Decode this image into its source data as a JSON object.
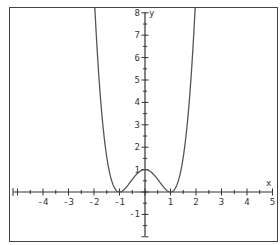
{
  "chart_data": {
    "type": "line",
    "title": "",
    "xlabel": "x",
    "ylabel": "y",
    "xlim": [
      -5,
      5
    ],
    "ylim": [
      -2,
      8
    ],
    "x_ticks": [
      -4,
      -3,
      -2,
      -1,
      1,
      2,
      3,
      4,
      5
    ],
    "y_ticks": [
      -1,
      1,
      2,
      3,
      4,
      5,
      6,
      7,
      8
    ],
    "minor_tick_step": 0.5,
    "grid": false,
    "series": [
      {
        "name": "f(x) = (x^2 - 1)^2",
        "description": "quartic with local maximum at (0,1) and minima at (-1,0) and (1,0)",
        "key_points": [
          {
            "x": -1.96,
            "y": 8
          },
          {
            "x": -1,
            "y": 0
          },
          {
            "x": 0,
            "y": 1
          },
          {
            "x": 1,
            "y": 0
          },
          {
            "x": 1.96,
            "y": 8
          }
        ]
      }
    ]
  },
  "colors": {
    "curve": "#555555",
    "axis": "#333333",
    "frame": "#444444",
    "background": "#ffffff"
  }
}
